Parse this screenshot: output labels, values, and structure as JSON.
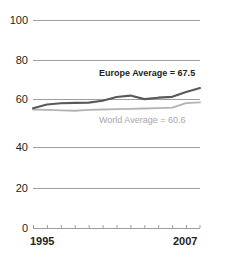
{
  "chart_data": {
    "type": "line",
    "title": "",
    "subtitle": "",
    "xlabel": "",
    "ylabel": "",
    "xlim": [
      1995,
      2007
    ],
    "ylim": [
      0,
      100
    ],
    "grid": true,
    "legend_position": "inline-annotation",
    "y_ticks": [
      "100",
      "80",
      "60",
      "40",
      "20",
      "0"
    ],
    "y_tick_values": [
      100,
      80,
      60,
      40,
      20,
      0
    ],
    "x_ticks": [
      "1995",
      "2007"
    ],
    "x_tick_values": [
      1995,
      2007
    ],
    "x": [
      1995,
      1996,
      1997,
      1998,
      1999,
      2000,
      2001,
      2002,
      2003,
      2004,
      2005,
      2006,
      2007
    ],
    "series": [
      {
        "name": "Europe Average",
        "color": "#595959",
        "final_value": 67.5,
        "annotation": "Europe Average = 67.5",
        "values": [
          57.8,
          59.6,
          60.2,
          60.4,
          60.5,
          61.4,
          63.2,
          63.9,
          62.2,
          62.9,
          63.3,
          65.6,
          67.5
        ]
      },
      {
        "name": "World Average",
        "color": "#b3b3b3",
        "final_value": 60.6,
        "annotation": "World Average = 60.6",
        "values": [
          57.2,
          57.0,
          56.8,
          56.6,
          57.0,
          57.2,
          57.4,
          57.5,
          57.7,
          57.9,
          58.1,
          60.3,
          60.6
        ]
      }
    ]
  },
  "axis": {
    "y_labels": [
      {
        "text": "100",
        "value": 100
      },
      {
        "text": "80",
        "value": 80
      },
      {
        "text": "60",
        "value": 60
      },
      {
        "text": "40",
        "value": 40
      },
      {
        "text": "20",
        "value": 20
      },
      {
        "text": "0",
        "value": 0
      }
    ],
    "x_labels": [
      {
        "text": "1995",
        "value": 1995
      },
      {
        "text": "2007",
        "value": 2007
      }
    ]
  },
  "annotations": {
    "europe": "Europe Average = 67.5",
    "world": "World Average = 60.6"
  },
  "colors": {
    "europe_line": "#595959",
    "world_line": "#b3b3b3",
    "gridline": "#9d9d9d",
    "axis_text": "#231f20",
    "world_text": "#a6a6a6",
    "background": "#ffffff"
  }
}
